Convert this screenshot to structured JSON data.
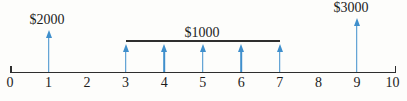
{
  "diagram": {
    "type": "cash-flow-timeline",
    "payments": [
      {
        "label": "$2000",
        "amount": 2000,
        "period": 1
      },
      {
        "label": "$1000",
        "amount": 1000,
        "periods": [
          3,
          4,
          5,
          6,
          7
        ]
      },
      {
        "label": "$3000",
        "amount": 3000,
        "period": 9
      }
    ],
    "axis": {
      "ticks": [
        "0",
        "1",
        "2",
        "3",
        "4",
        "5",
        "6",
        "7",
        "8",
        "9",
        "10"
      ],
      "range": [
        0,
        10
      ]
    },
    "colors": {
      "arrow": "#3f8fcc",
      "axis": "#2e2e2e"
    }
  },
  "chart_data": {
    "type": "bar",
    "title": "",
    "xlabel": "",
    "ylabel": "",
    "categories": [
      0,
      1,
      2,
      3,
      4,
      5,
      6,
      7,
      8,
      9,
      10
    ],
    "values": [
      0,
      2000,
      0,
      1000,
      1000,
      1000,
      1000,
      1000,
      0,
      3000,
      0
    ],
    "annotations": [
      "$2000 at t=1",
      "$1000 each at t=3..7",
      "$3000 at t=9"
    ],
    "xlim": [
      0,
      10
    ]
  }
}
